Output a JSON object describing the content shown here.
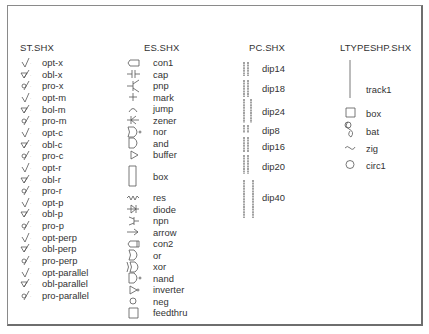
{
  "columns": [
    {
      "title": "ST.SHX",
      "items": [
        {
          "label": "opt-x",
          "icon": "optional-check-x-icon"
        },
        {
          "label": "obl-x",
          "icon": "obligatory-check-x-icon"
        },
        {
          "label": "pro-x",
          "icon": "prohibited-check-x-icon"
        },
        {
          "label": "opt-m",
          "icon": "optional-check-m-icon"
        },
        {
          "label": "bol-m",
          "icon": "obligatory-check-m-icon"
        },
        {
          "label": "pro-m",
          "icon": "prohibited-check-m-icon"
        },
        {
          "label": "opt-c",
          "icon": "optional-check-c-icon"
        },
        {
          "label": "obl-c",
          "icon": "obligatory-check-c-icon"
        },
        {
          "label": "pro-c",
          "icon": "prohibited-check-c-icon"
        },
        {
          "label": "opt-r",
          "icon": "optional-check-r-icon"
        },
        {
          "label": "obl-r",
          "icon": "obligatory-check-r-icon"
        },
        {
          "label": "pro-r",
          "icon": "prohibited-check-r-icon"
        },
        {
          "label": "opt-p",
          "icon": "optional-check-p-icon"
        },
        {
          "label": "obl-p",
          "icon": "obligatory-check-p-icon"
        },
        {
          "label": "pro-p",
          "icon": "prohibited-check-p-icon"
        },
        {
          "label": "opt-perp",
          "icon": "optional-check-perp-icon"
        },
        {
          "label": "obl-perp",
          "icon": "obligatory-check-perp-icon"
        },
        {
          "label": "pro-perp",
          "icon": "prohibited-check-perp-icon"
        },
        {
          "label": "opt-parallel",
          "icon": "optional-check-parallel-icon"
        },
        {
          "label": "obl-parallel",
          "icon": "obligatory-check-parallel-icon"
        },
        {
          "label": "pro-parallel",
          "icon": "prohibited-check-parallel-icon"
        }
      ]
    },
    {
      "title": "ES.SHX",
      "items": [
        {
          "label": "con1",
          "icon": "connector-icon"
        },
        {
          "label": "cap",
          "icon": "capacitor-icon"
        },
        {
          "label": "pnp",
          "icon": "pnp-transistor-icon"
        },
        {
          "label": "mark",
          "icon": "plus-mark-icon"
        },
        {
          "label": "jump",
          "icon": "jump-arc-icon"
        },
        {
          "label": "zener",
          "icon": "zener-diode-icon"
        },
        {
          "label": "nor",
          "icon": "nor-gate-icon"
        },
        {
          "label": "and",
          "icon": "and-gate-icon"
        },
        {
          "label": "buffer",
          "icon": "buffer-triangle-icon"
        },
        {
          "label": "box",
          "icon": "tall-box-icon"
        },
        {
          "label": "res",
          "icon": "resistor-icon"
        },
        {
          "label": "diode",
          "icon": "diode-icon"
        },
        {
          "label": "npn",
          "icon": "npn-transistor-icon"
        },
        {
          "label": "arrow",
          "icon": "arrow-icon"
        },
        {
          "label": "con2",
          "icon": "connector-2-icon"
        },
        {
          "label": "or",
          "icon": "or-gate-icon"
        },
        {
          "label": "xor",
          "icon": "xor-gate-icon"
        },
        {
          "label": "nand",
          "icon": "nand-gate-icon"
        },
        {
          "label": "inverter",
          "icon": "inverter-icon"
        },
        {
          "label": "neg",
          "icon": "negation-circle-icon"
        },
        {
          "label": "feedthru",
          "icon": "feedthru-square-icon"
        }
      ]
    },
    {
      "title": "PC.SHX",
      "items": [
        {
          "label": "dip14",
          "icon": "dip14-package-icon"
        },
        {
          "label": "dip18",
          "icon": "dip18-package-icon"
        },
        {
          "label": "dip24",
          "icon": "dip24-package-icon"
        },
        {
          "label": "dip8",
          "icon": "dip8-package-icon"
        },
        {
          "label": "dip16",
          "icon": "dip16-package-icon"
        },
        {
          "label": "dip20",
          "icon": "dip20-package-icon"
        },
        {
          "label": "dip40",
          "icon": "dip40-package-icon"
        }
      ]
    },
    {
      "title": "LTYPESHP.SHX",
      "items": [
        {
          "label": "track1",
          "icon": "track-line-icon"
        },
        {
          "label": "box",
          "icon": "square-icon"
        },
        {
          "label": "bat",
          "icon": "batting-icon"
        },
        {
          "label": "zig",
          "icon": "zigzag-icon"
        },
        {
          "label": "circ1",
          "icon": "circle-icon"
        }
      ]
    }
  ]
}
